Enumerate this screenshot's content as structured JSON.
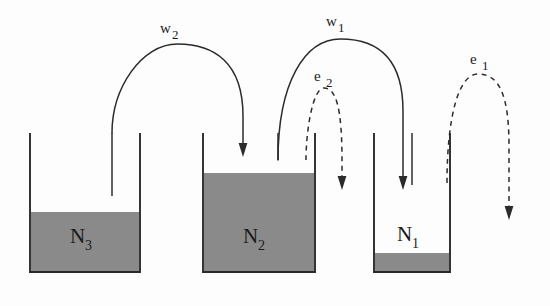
{
  "diagram": {
    "background_color": "#fdfdfd",
    "ink_color": "#2b2b2b",
    "fill_color": "#8a8a8a",
    "tanks": [
      {
        "id": "tank-n3",
        "label": "N",
        "subscript": "3",
        "x": 30,
        "y": 133,
        "width": 110,
        "height": 139,
        "fill_top": 212,
        "label_x": 85,
        "label_y": 240,
        "straw_x": 112,
        "straw_top": 133,
        "straw_bottom": 196
      },
      {
        "id": "tank-n2",
        "label": "N",
        "subscript": "2",
        "x": 203,
        "y": 133,
        "width": 112,
        "height": 139,
        "fill_top": 173,
        "label_x": 258,
        "label_y": 240,
        "straw_x": 278,
        "straw_top": 133,
        "straw_bottom": 160
      },
      {
        "id": "tank-n1",
        "label": "N",
        "subscript": "1",
        "x": 374,
        "y": 133,
        "width": 76,
        "height": 139,
        "fill_top": 253,
        "label_x": 412,
        "label_y": 238,
        "straw_x": 412,
        "straw_top": 133,
        "straw_bottom": 185
      }
    ],
    "flows": [
      {
        "id": "flow-w2",
        "label": "w",
        "subscript": "2",
        "style": "solid",
        "label_x": 168,
        "label_y": 32,
        "from_x": 112,
        "to_x": 243,
        "apex_y": 44,
        "start_y": 133,
        "end_y": 152
      },
      {
        "id": "flow-w1",
        "label": "w",
        "subscript": "1",
        "style": "solid",
        "label_x": 334,
        "label_y": 25,
        "from_x": 278,
        "to_x": 403,
        "apex_y": 39,
        "start_y": 160,
        "end_y": 185
      },
      {
        "id": "flow-e2",
        "label": "e",
        "subscript": "2",
        "style": "dashed",
        "label_x": 322,
        "label_y": 80,
        "from_x": 306,
        "to_x": 342,
        "apex_y": 88,
        "start_y": 160,
        "end_y": 185
      },
      {
        "id": "flow-e1",
        "label": "e",
        "subscript": "1",
        "style": "dashed",
        "label_x": 478,
        "label_y": 63,
        "from_x": 447,
        "to_x": 509,
        "apex_y": 74,
        "start_y": 183,
        "end_y": 215
      }
    ]
  }
}
